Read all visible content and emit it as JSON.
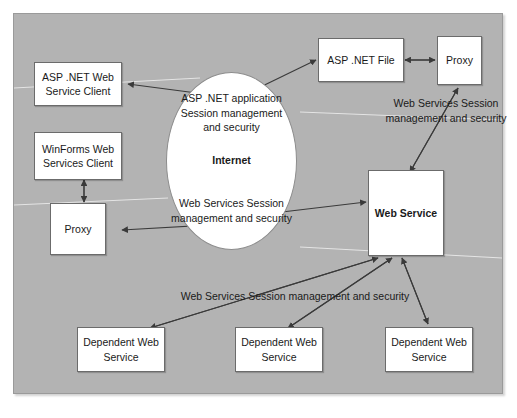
{
  "diagram": {
    "panel_color": "#b3b3b3",
    "node_fill": "#ffffff",
    "line_color": "#404040",
    "nodes": {
      "asp_net_web_service_client": "ASP .NET Web\nService Client",
      "winforms_web_services_client": "WinForms Web\nServices Client",
      "proxy_left": "Proxy",
      "asp_net_file": "ASP .NET File",
      "proxy_right": "Proxy",
      "web_service": "Web Service",
      "dependent_web_service_1": "Dependent Web\nService",
      "dependent_web_service_2": "Dependent Web\nService",
      "dependent_web_service_3": "Dependent Web\nService"
    },
    "ellipse": {
      "top_text": "ASP .NET application\nSession management\nand security",
      "center_text": "Internet",
      "bottom_text": "Web Services Session\nmanagement and security"
    },
    "labels": {
      "right_label": "Web Services Session\nmanagement and security",
      "bottom_label": "Web Services Session management and security"
    }
  }
}
